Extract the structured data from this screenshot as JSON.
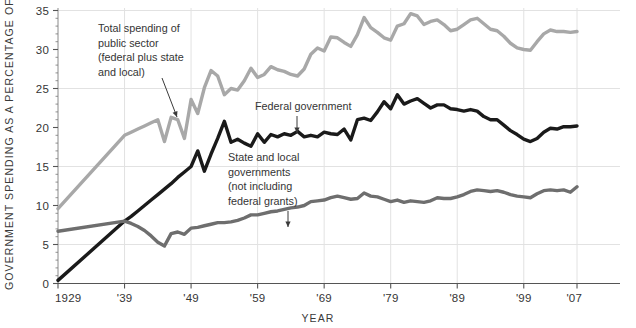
{
  "chart_data": {
    "type": "line",
    "title": "",
    "subtitle": "",
    "xlabel": "YEAR",
    "ylabel": "GOVERNMENT SPENDING AS A PERCENTAGE OF GDP",
    "xlim": [
      1929,
      2007
    ],
    "ylim": [
      0,
      35
    ],
    "grid": true,
    "legend_position": "inline-annotations",
    "y_ticks": [
      0,
      5,
      10,
      15,
      20,
      25,
      30,
      35
    ],
    "y_tick_labels": [
      "0",
      "5",
      "10",
      "15",
      "20",
      "25",
      "30",
      "35"
    ],
    "y_gridlines": [
      5,
      15,
      25,
      35
    ],
    "x_ticks": [
      1929,
      1939,
      1949,
      1959,
      1969,
      1979,
      1989,
      1999,
      2007
    ],
    "x_tick_labels": [
      "1929",
      "'39",
      "'49",
      "'59",
      "'69",
      "'79",
      "'89",
      "'99",
      "'07"
    ],
    "x": [
      1929,
      1939,
      1940,
      1941,
      1942,
      1943,
      1944,
      1945,
      1946,
      1947,
      1948,
      1949,
      1950,
      1951,
      1952,
      1953,
      1954,
      1955,
      1956,
      1957,
      1958,
      1959,
      1960,
      1961,
      1962,
      1963,
      1964,
      1965,
      1966,
      1967,
      1968,
      1969,
      1970,
      1971,
      1972,
      1973,
      1974,
      1975,
      1976,
      1977,
      1978,
      1979,
      1980,
      1981,
      1982,
      1983,
      1984,
      1985,
      1986,
      1987,
      1988,
      1989,
      1990,
      1991,
      1992,
      1993,
      1994,
      1995,
      1996,
      1997,
      1998,
      1999,
      2000,
      2001,
      2002,
      2003,
      2004,
      2005,
      2006,
      2007
    ],
    "series": [
      {
        "name": "Total spending of public sector (federal plus state and local)",
        "color": "#a8a8a8",
        "values": [
          9.6,
          19.0,
          19.4,
          19.8,
          20.2,
          20.6,
          21.0,
          18.2,
          21.3,
          21.0,
          18.6,
          23.6,
          21.8,
          25.1,
          27.3,
          26.6,
          24.2,
          25.0,
          24.8,
          26.0,
          27.6,
          26.4,
          26.8,
          27.8,
          27.4,
          27.2,
          26.8,
          26.6,
          27.5,
          29.4,
          30.2,
          29.8,
          31.6,
          31.5,
          30.9,
          30.4,
          31.9,
          34.1,
          32.8,
          32.2,
          31.5,
          31.2,
          33.0,
          33.3,
          34.6,
          34.3,
          33.2,
          33.6,
          33.8,
          33.2,
          32.4,
          32.6,
          33.2,
          33.8,
          34.0,
          33.3,
          32.6,
          32.4,
          31.7,
          30.8,
          30.2,
          30.0,
          29.9,
          31.0,
          32.0,
          32.5,
          32.3,
          32.3,
          32.2,
          32.3
        ]
      },
      {
        "name": "Federal government",
        "color": "#1a1a1a",
        "values": [
          0.4,
          8.0,
          8.6,
          9.3,
          10.0,
          10.7,
          11.4,
          12.1,
          12.8,
          13.6,
          14.3,
          15.0,
          17.0,
          14.4,
          16.6,
          18.6,
          20.8,
          18.1,
          18.5,
          18.0,
          17.6,
          19.2,
          18.1,
          19.1,
          18.8,
          19.2,
          19.0,
          19.5,
          18.8,
          19.0,
          18.8,
          19.4,
          19.2,
          19.1,
          19.8,
          18.4,
          21.0,
          21.2,
          20.9,
          22.0,
          23.3,
          22.4,
          24.2,
          23.0,
          23.4,
          23.7,
          23.1,
          22.5,
          22.9,
          22.9,
          22.4,
          22.3,
          22.1,
          22.3,
          22.1,
          21.4,
          21.0,
          21.0,
          20.3,
          19.6,
          19.1,
          18.5,
          18.2,
          18.6,
          19.4,
          19.9,
          19.8,
          20.1,
          20.1,
          20.2
        ]
      },
      {
        "name": "State and local governments (not including federal grants)",
        "color": "#6e6e6e",
        "values": [
          6.7,
          8.0,
          7.7,
          7.3,
          6.8,
          6.1,
          5.3,
          4.8,
          6.4,
          6.6,
          6.3,
          7.1,
          7.2,
          7.4,
          7.6,
          7.8,
          7.8,
          7.9,
          8.1,
          8.4,
          8.8,
          8.8,
          9.0,
          9.2,
          9.3,
          9.5,
          9.7,
          9.8,
          10.0,
          10.5,
          10.6,
          10.7,
          11.0,
          11.2,
          11.0,
          10.8,
          10.9,
          11.6,
          11.2,
          11.1,
          10.8,
          10.5,
          10.7,
          10.4,
          10.6,
          10.5,
          10.4,
          10.6,
          11.0,
          10.9,
          10.9,
          11.1,
          11.4,
          11.8,
          12.0,
          11.9,
          11.8,
          11.9,
          11.7,
          11.4,
          11.2,
          11.1,
          11.0,
          11.5,
          11.9,
          12.0,
          11.9,
          12.0,
          11.7,
          12.4
        ]
      }
    ],
    "annotations": [
      {
        "id": "total-spending",
        "lines": [
          "Total spending of",
          "public sector",
          "(federal plus state",
          "and local)"
        ],
        "text_x": 98,
        "text_y": 32,
        "arrow": {
          "x1": 162,
          "y1": 78,
          "x2": 177,
          "y2": 117
        }
      },
      {
        "id": "federal-government",
        "lines": [
          "Federal government"
        ],
        "text_x": 255,
        "text_y": 110,
        "arrow": {
          "x1": 297,
          "y1": 116,
          "x2": 297,
          "y2": 133
        }
      },
      {
        "id": "state-and-local",
        "lines": [
          "State and local",
          "governments",
          "(not including",
          "federal grants)"
        ],
        "text_x": 228,
        "text_y": 161,
        "arrow": {
          "x1": 288,
          "y1": 211,
          "x2": 288,
          "y2": 227
        }
      }
    ],
    "colors": {
      "total": "#a8a8a8",
      "federal": "#1a1a1a",
      "state_local": "#6e6e6e",
      "grid": "#e2e2e2",
      "axis": "#8a8a8a",
      "text": "#353535",
      "background": "#ffffff"
    }
  }
}
